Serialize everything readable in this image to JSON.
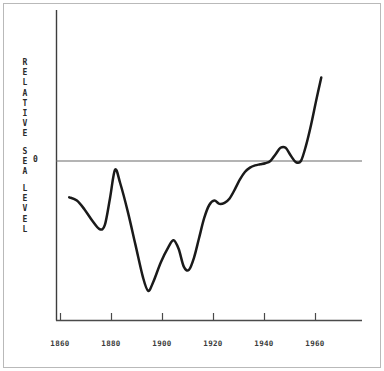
{
  "figure": {
    "background_color": "#ffffff",
    "frame_color": "#b9b9b9",
    "axis_color": "#4a4a4a",
    "curve_color": "#1a1a1a",
    "zero_label": "0"
  },
  "axis_title": {
    "full_text": "RELATIVE SEA LEVEL",
    "words": [
      "RELATIVE",
      "SEA",
      "LEVEL"
    ],
    "letters": [
      "R",
      "E",
      "L",
      "A",
      "T",
      "I",
      "V",
      "E",
      "",
      "S",
      "E",
      "A",
      "",
      "L",
      "E",
      "V",
      "E",
      "L"
    ]
  },
  "chart_data": {
    "type": "line",
    "title": "",
    "subtitle": "",
    "xlabel": "",
    "ylabel": "RELATIVE SEA LEVEL",
    "xlim": [
      1855,
      1975
    ],
    "ylim": [
      -1.45,
      1.0
    ],
    "grid": false,
    "legend": null,
    "xticks": [
      1860,
      1880,
      1900,
      1920,
      1940,
      1960
    ],
    "xticklabels": [
      "1860",
      "1880",
      "1900",
      "1920",
      "1940",
      "1960"
    ],
    "yticks": [
      0
    ],
    "yticklabels": [
      "0"
    ],
    "reference_lines": [
      {
        "axis": "y",
        "value": 0,
        "label": "0",
        "style": "solid"
      }
    ],
    "annotations": [],
    "series": [
      {
        "name": "relative sea level",
        "x": [
          1860,
          1863,
          1866,
          1869,
          1872,
          1874,
          1876,
          1878,
          1880,
          1883,
          1886,
          1889,
          1891,
          1893,
          1896,
          1899,
          1901,
          1903,
          1905,
          1907,
          1909,
          1911,
          1913,
          1915,
          1917,
          1919,
          1921,
          1923,
          1925,
          1927,
          1929,
          1931,
          1933,
          1935,
          1937,
          1939,
          1941,
          1943,
          1945,
          1947,
          1949,
          1951,
          1953,
          1955,
          1957,
          1959
        ],
        "y": [
          -0.33,
          -0.36,
          -0.44,
          -0.54,
          -0.62,
          -0.58,
          -0.34,
          -0.08,
          -0.2,
          -0.46,
          -0.76,
          -1.06,
          -1.18,
          -1.1,
          -0.92,
          -0.78,
          -0.72,
          -0.8,
          -0.96,
          -0.99,
          -0.88,
          -0.7,
          -0.52,
          -0.4,
          -0.36,
          -0.39,
          -0.38,
          -0.34,
          -0.26,
          -0.17,
          -0.1,
          -0.06,
          -0.04,
          -0.03,
          -0.02,
          0.0,
          0.06,
          0.12,
          0.12,
          0.05,
          -0.01,
          0.0,
          0.14,
          0.33,
          0.55,
          0.76
        ]
      }
    ]
  }
}
